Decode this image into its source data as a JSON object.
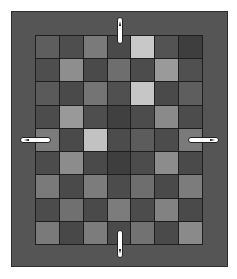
{
  "board": {
    "columns": 7,
    "rows": 9,
    "frame_color": "#555555",
    "line_color": "#1e1e1e",
    "cells": [
      [
        "#5e5e5e",
        "#4e4e4e",
        "#7a7a7a",
        "#4a4a4a",
        "#c8c8c8",
        "#535353",
        "#3e3e3e"
      ],
      [
        "#4e4e4e",
        "#8e8e8e",
        "#4a4a4a",
        "#6e6e6e",
        "#4c4c4c",
        "#9a9a9a",
        "#505050"
      ],
      [
        "#5a5a5a",
        "#4a4a4a",
        "#747474",
        "#505050",
        "#c6c6c6",
        "#4a4a4a",
        "#5e5e5e"
      ],
      [
        "#4c4c4c",
        "#999999",
        "#4e4e4e",
        "#404040",
        "#4c4c4c",
        "#8a8a8a",
        "#4c4c4c"
      ],
      [
        "#7c7c7c",
        "#4a4a4a",
        "#c2c2c2",
        "#4c4c4c",
        "#5c5c5c",
        "#4c4c4c",
        "#7a7a7a"
      ],
      [
        "#4c4c4c",
        "#8c8c8c",
        "#4a4a4a",
        "#3e3e3e",
        "#4c4c4c",
        "#8c8c8c",
        "#4a4a4a"
      ],
      [
        "#7a7a7a",
        "#4a4a4a",
        "#7c7c7c",
        "#4c4c4c",
        "#6e6e6e",
        "#4a4a4a",
        "#7c7c7c"
      ],
      [
        "#4c4c4c",
        "#707070",
        "#4a4a4a",
        "#7c7c7c",
        "#4c4c4c",
        "#828282",
        "#4a4a4a"
      ],
      [
        "#7a7a7a",
        "#484848",
        "#7c7c7c",
        "#4a4a4a",
        "#727272",
        "#4a4a4a",
        "#8a8a8a"
      ]
    ]
  },
  "controls": {
    "arrows": [
      {
        "direction": "up",
        "icon": "arrow-up-icon"
      },
      {
        "direction": "down",
        "icon": "arrow-down-icon"
      },
      {
        "direction": "left",
        "icon": "arrow-left-icon"
      },
      {
        "direction": "right",
        "icon": "arrow-right-icon"
      }
    ]
  }
}
